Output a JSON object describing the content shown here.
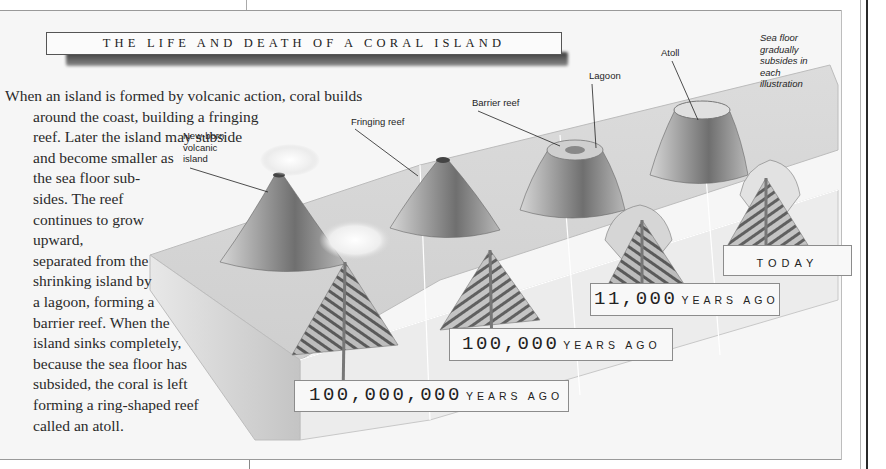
{
  "title": "THE LIFE AND DEATH OF A CORAL ISLAND",
  "intro_lines": [
    "When an island is formed by volcanic action, coral builds",
    "around the coast, building a fringing",
    "reef. Later the island may subside",
    "and become smaller as",
    "the sea floor sub-",
    "sides. The reef",
    "continues to grow",
    "upward,",
    "separated from the",
    "shrinking island by",
    "a lagoon, forming a",
    "barrier reef. When the",
    "island sinks completely,",
    "because the sea floor has",
    "subsided, the coral is left",
    "forming a ring-shaped reef",
    "called an atoll."
  ],
  "labels": {
    "new_born": [
      "New-born",
      "volcanic",
      "island"
    ],
    "fringing_reef": "Fringing reef",
    "barrier_reef": "Barrier reef",
    "lagoon": "Lagoon",
    "atoll": "Atoll",
    "sea_floor_note": [
      "Sea floor",
      "gradually",
      "subsides in",
      "each",
      "illustration"
    ]
  },
  "eras": [
    {
      "number": "100,000,000",
      "unit": "YEARS AGO"
    },
    {
      "number": "100,000",
      "unit": "YEARS AGO"
    },
    {
      "number": "11,000",
      "unit": "YEARS AGO"
    },
    {
      "number": "",
      "unit": "TODAY"
    }
  ],
  "colors": {
    "background": "#f6f6f6",
    "text": "#2a2a2a",
    "frame": "#9a9a9a",
    "shadow": "#3a3a3a"
  }
}
